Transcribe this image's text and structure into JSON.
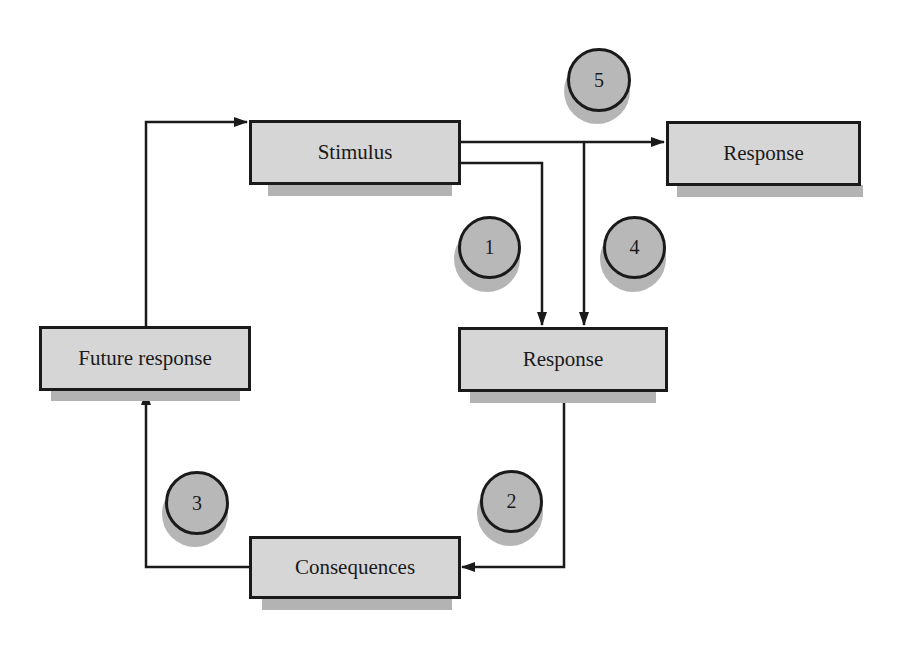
{
  "diagram": {
    "nodes": {
      "stimulus": {
        "label": "Stimulus"
      },
      "response_top": {
        "label": "Response"
      },
      "response_mid": {
        "label": "Response"
      },
      "future_response": {
        "label": "Future response"
      },
      "consequences": {
        "label": "Consequences"
      }
    },
    "markers": [
      {
        "id": "marker-1",
        "label": "1"
      },
      {
        "id": "marker-2",
        "label": "2"
      },
      {
        "id": "marker-3",
        "label": "3"
      },
      {
        "id": "marker-4",
        "label": "4"
      },
      {
        "id": "marker-5",
        "label": "5"
      }
    ],
    "edges": [
      {
        "from": "Stimulus",
        "to": "Response (top)"
      },
      {
        "from": "Stimulus",
        "to": "Response (middle)",
        "via": "branch 4"
      },
      {
        "from": "Stimulus",
        "to": "Response (middle)",
        "via": "path 1"
      },
      {
        "from": "Response (middle)",
        "to": "Consequences"
      },
      {
        "from": "Consequences",
        "to": "Future response"
      },
      {
        "from": "Future response",
        "to": "Stimulus"
      }
    ],
    "colors": {
      "box_fill": "#d6d6d6",
      "box_shadow": "#b3b3b3",
      "circle_fill": "#b8b8b8",
      "line": "#1a1a1a"
    }
  }
}
